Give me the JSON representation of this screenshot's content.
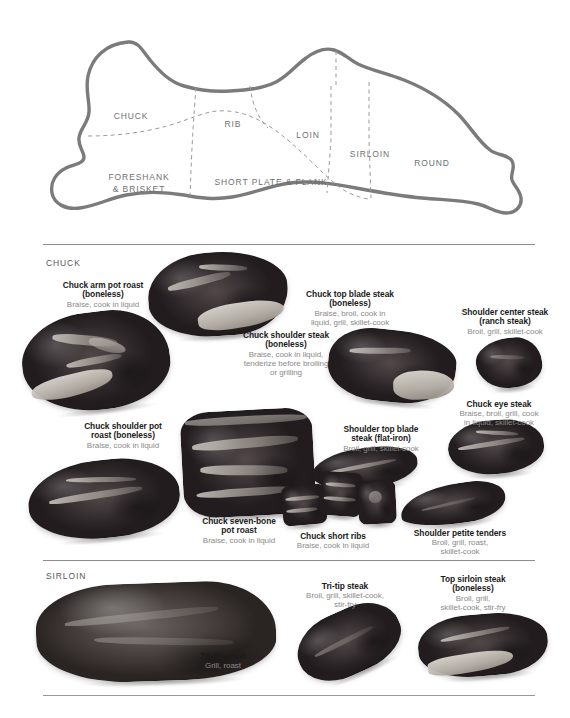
{
  "diagram": {
    "name": "beef-carcass-primal-diagram",
    "outline_color": "#7b7b7b",
    "label_color": "#6f6f6f",
    "primals": [
      {
        "id": "chuck",
        "label": "CHUCK",
        "x": 131,
        "y": 99
      },
      {
        "id": "rib",
        "label": "RIB",
        "x": 233,
        "y": 107
      },
      {
        "id": "loin",
        "label": "LOIN",
        "x": 308,
        "y": 118
      },
      {
        "id": "sirloin",
        "label": "SIRLOIN",
        "x": 370,
        "y": 137
      },
      {
        "id": "round",
        "label": "ROUND",
        "x": 432,
        "y": 146
      },
      {
        "id": "foreshank",
        "label": "FORESHANK",
        "x": 139,
        "y": 160
      },
      {
        "id": "brisket",
        "label": "& BRISKET",
        "x": 139,
        "y": 172
      },
      {
        "id": "shortplate",
        "label": "SHORT PLATE & FLANK",
        "x": 271,
        "y": 165
      }
    ]
  },
  "sections": [
    {
      "id": "chuck",
      "title": "CHUCK",
      "cuts": [
        {
          "id": "chuck-arm-pot-roast",
          "name": "Chuck arm pot roast\n(boneless)",
          "methods": "Braise, cook in liquid"
        },
        {
          "id": "chuck-top-blade-steak",
          "name": "Chuck top blade steak\n(boneless)",
          "methods": "Braise, broil, cook in\nliquid, grill, skillet-cook"
        },
        {
          "id": "chuck-shoulder-steak",
          "name": "Chuck shoulder steak\n(boneless)",
          "methods": "Braise, cook in liquid,\ntenderize before broiling\nor grilling"
        },
        {
          "id": "shoulder-center-steak",
          "name": "Shoulder center steak\n(ranch steak)",
          "methods": "Broil, grill, skillet-cook"
        },
        {
          "id": "chuck-eye-steak",
          "name": "Chuck eye steak",
          "methods": "Braise, broil, grill, cook\nin liquid, skillet-cook"
        },
        {
          "id": "chuck-shoulder-pot-roast",
          "name": "Chuck shoulder pot\nroast (boneless)",
          "methods": "Braise, cook in liquid"
        },
        {
          "id": "shoulder-top-blade-steak",
          "name": "Shoulder top blade\nsteak (flat-iron)",
          "methods": "Broil, grill, skillet-cook"
        },
        {
          "id": "chuck-seven-bone-pot-roast",
          "name": "Chuck seven-bone\npot roast",
          "methods": "Braise, cook in liquid"
        },
        {
          "id": "chuck-short-ribs",
          "name": "Chuck short ribs",
          "methods": "Braise, cook in liquid"
        },
        {
          "id": "shoulder-petite-tenders",
          "name": "Shoulder petite tenders",
          "methods": "Broil, grill, roast,\nskillet-cook"
        }
      ]
    },
    {
      "id": "sirloin",
      "title": "SIRLOIN",
      "cuts": [
        {
          "id": "tri-tip-roast",
          "name": "Tri-tip roast",
          "methods": "Grill, roast"
        },
        {
          "id": "tri-tip-steak",
          "name": "Tri-tip steak",
          "methods": "Broil, grill, skillet-cook,\nstir-fry"
        },
        {
          "id": "top-sirloin-steak",
          "name": "Top sirloin steak\n(boneless)",
          "methods": "Broil, grill,\nskillet-cook, stir-fry"
        }
      ]
    }
  ]
}
